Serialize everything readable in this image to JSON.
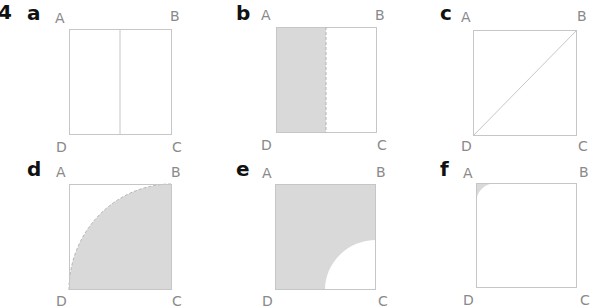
{
  "question_number": "4",
  "colors": {
    "line": "#c6c6c6",
    "fill": "#d9d9d9",
    "dash": "#b4b4b4",
    "label": "#8a8a8a"
  },
  "vertices": {
    "a": "A",
    "b": "B",
    "c": "C",
    "d": "D"
  },
  "panels": [
    {
      "letter": "a",
      "description": "square divided by vertical midline"
    },
    {
      "letter": "b",
      "description": "left half shaded, dashed boundary"
    },
    {
      "letter": "c",
      "description": "square with diagonal from D to B"
    },
    {
      "letter": "d",
      "description": "quarter circle centered at C shaded, radius = side"
    },
    {
      "letter": "e",
      "description": "square shaded except quarter circle at C of radius half side"
    },
    {
      "letter": "f",
      "description": "small shaded corner region at A outside arc"
    }
  ]
}
